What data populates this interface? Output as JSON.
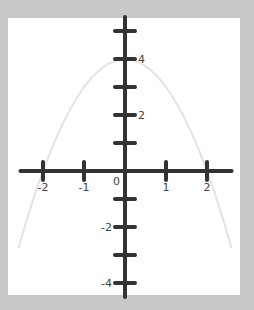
{
  "chart_data": {
    "type": "line",
    "title": "",
    "xlabel": "",
    "ylabel": "",
    "function": "y = 4 - x^2",
    "xlim": [
      -2.55,
      2.6
    ],
    "ylim": [
      -4.5,
      5.5
    ],
    "grid": false,
    "x_ticks": [
      -2,
      -1,
      1,
      2
    ],
    "x_tick_labels": [
      "-2",
      "-1",
      "1",
      "2"
    ],
    "y_ticks": [
      -4,
      -3,
      -2,
      -1,
      1,
      2,
      3,
      4,
      5
    ],
    "y_tick_labels": {
      "4": "4",
      "2": "2",
      "-2": "-2",
      "-4": "-4"
    },
    "origin_label": "0",
    "series": [
      {
        "name": "parabola",
        "x": [
          -2.6,
          -2.4,
          -2.2,
          -2.0,
          -1.8,
          -1.6,
          -1.4,
          -1.2,
          -1.0,
          -0.8,
          -0.6,
          -0.4,
          -0.2,
          0.0,
          0.2,
          0.4,
          0.6,
          0.8,
          1.0,
          1.2,
          1.4,
          1.6,
          1.8,
          2.0,
          2.2,
          2.4,
          2.6
        ],
        "y": [
          -2.76,
          -1.76,
          -0.84,
          0.0,
          0.76,
          1.44,
          2.04,
          2.56,
          3.0,
          3.36,
          3.64,
          3.84,
          3.96,
          4.0,
          3.96,
          3.84,
          3.64,
          3.36,
          3.0,
          2.56,
          2.04,
          1.44,
          0.76,
          0.0,
          -0.84,
          -1.76,
          -2.76
        ],
        "color": "#e3e3e3"
      }
    ],
    "axis_color": "#333333"
  }
}
